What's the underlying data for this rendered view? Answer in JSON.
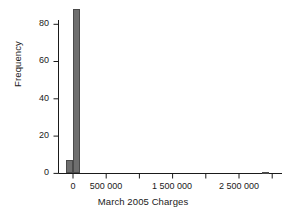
{
  "chart_data": {
    "type": "bar",
    "title": "",
    "subtitle": "",
    "xlabel": "March 2005 Charges",
    "ylabel": "Frequency",
    "grid": false,
    "legend": false,
    "xlim": [
      -220000,
      3150000
    ],
    "ylim": [
      0,
      92
    ],
    "ytick_labels": [
      "0",
      "20",
      "40",
      "60",
      "80"
    ],
    "ytick_values": [
      0,
      20,
      40,
      60,
      80
    ],
    "xtick_labels": [
      "0",
      "500 000",
      "1 500 000",
      "2 500 000"
    ],
    "xtick_values": [
      0,
      500000,
      1500000,
      2500000
    ],
    "xtick_all_values": [
      0,
      500000,
      1000000,
      1500000,
      2000000,
      2500000,
      3000000
    ],
    "bin_width": 100000,
    "bars": [
      {
        "x": -50000,
        "value": 7,
        "label": "near-zero-low-bin"
      },
      {
        "x": 50000,
        "value": 88,
        "label": "zero-bin-tall"
      },
      {
        "x": 2900000,
        "value": 1,
        "label": "outlier-bin"
      }
    ],
    "bar_color": "#6e6e6e",
    "axis_color": "#1a1a1a"
  },
  "axes": {
    "y_title": "Frequency",
    "x_title": "March 2005 Charges"
  }
}
